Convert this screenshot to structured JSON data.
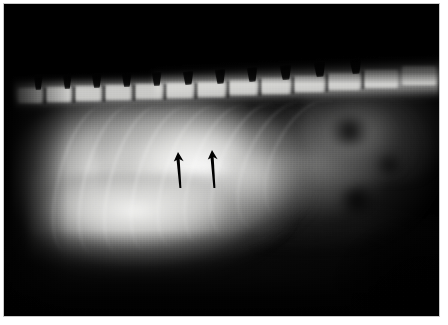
{
  "image": {
    "kind": "radiograph",
    "modality": "X-ray",
    "view": "right lateral",
    "region": "thorax and cranial abdomen",
    "subject": "small animal (canine/feline)",
    "background_color": "#000000",
    "page_background": "#ffffff",
    "frame_color": "#c9c9c9",
    "width": 448,
    "height": 325,
    "caption": "",
    "visible_text": ""
  },
  "annotations": {
    "arrow_color": "#000000",
    "count": 2,
    "arrows": [
      {
        "name": "arrow-left",
        "label": "",
        "direction": "up",
        "x": 178,
        "y": 152,
        "length": 36,
        "tip_x": 178,
        "tip_y": 152,
        "tail_y": 188
      },
      {
        "name": "arrow-right",
        "label": "",
        "direction": "up",
        "x": 212,
        "y": 150,
        "length": 38,
        "tip_x": 212,
        "tip_y": 150,
        "tail_y": 188
      }
    ]
  },
  "anatomy": {
    "structures": [
      {
        "name": "vertebral-column",
        "label": "",
        "density": "bone"
      },
      {
        "name": "dorsal-spinous-processes",
        "label": "",
        "density": "bone"
      },
      {
        "name": "ribs",
        "label": "",
        "density": "bone"
      },
      {
        "name": "soft-tissue-mass",
        "label": "",
        "density": "soft-tissue"
      },
      {
        "name": "diaphragm",
        "label": "",
        "density": "soft-tissue"
      },
      {
        "name": "gas-filled-viscera",
        "label": "",
        "density": "gas"
      }
    ],
    "vertebrae": [
      {
        "x": 18,
        "y": 88,
        "w": 24,
        "h": 15
      },
      {
        "x": 46,
        "y": 87,
        "w": 25,
        "h": 15
      },
      {
        "x": 75,
        "y": 86,
        "w": 26,
        "h": 15
      },
      {
        "x": 105,
        "y": 85,
        "w": 26,
        "h": 15
      },
      {
        "x": 135,
        "y": 84,
        "w": 27,
        "h": 15
      },
      {
        "x": 166,
        "y": 83,
        "w": 27,
        "h": 15
      },
      {
        "x": 197,
        "y": 82,
        "w": 28,
        "h": 15
      },
      {
        "x": 229,
        "y": 80,
        "w": 28,
        "h": 15
      },
      {
        "x": 261,
        "y": 78,
        "w": 29,
        "h": 16
      },
      {
        "x": 294,
        "y": 76,
        "w": 30,
        "h": 16
      },
      {
        "x": 328,
        "y": 73,
        "w": 32,
        "h": 17
      },
      {
        "x": 364,
        "y": 70,
        "w": 34,
        "h": 18
      },
      {
        "x": 402,
        "y": 66,
        "w": 34,
        "h": 19
      }
    ],
    "spinous_processes": [
      {
        "x": 34,
        "y": 76,
        "w": 9,
        "h": 14,
        "rot": -2
      },
      {
        "x": 63,
        "y": 75,
        "w": 9,
        "h": 14,
        "rot": -2
      },
      {
        "x": 92,
        "y": 74,
        "w": 10,
        "h": 14,
        "rot": -3
      },
      {
        "x": 122,
        "y": 73,
        "w": 10,
        "h": 14,
        "rot": -3
      },
      {
        "x": 152,
        "y": 72,
        "w": 10,
        "h": 14,
        "rot": -3
      },
      {
        "x": 183,
        "y": 71,
        "w": 11,
        "h": 14,
        "rot": -4
      },
      {
        "x": 215,
        "y": 69,
        "w": 11,
        "h": 15,
        "rot": -4
      },
      {
        "x": 247,
        "y": 67,
        "w": 11,
        "h": 15,
        "rot": -4
      },
      {
        "x": 280,
        "y": 65,
        "w": 12,
        "h": 15,
        "rot": -5
      },
      {
        "x": 314,
        "y": 62,
        "w": 12,
        "h": 15,
        "rot": -5
      },
      {
        "x": 350,
        "y": 59,
        "w": 12,
        "h": 15,
        "rot": -5
      }
    ],
    "disc_spaces": [
      {
        "x": 44,
        "y": 88,
        "h": 16
      },
      {
        "x": 73,
        "y": 87,
        "h": 16
      },
      {
        "x": 103,
        "y": 86,
        "h": 16
      },
      {
        "x": 133,
        "y": 85,
        "h": 16
      },
      {
        "x": 164,
        "y": 84,
        "h": 16
      },
      {
        "x": 195,
        "y": 83,
        "h": 16
      },
      {
        "x": 227,
        "y": 81,
        "h": 17
      },
      {
        "x": 259,
        "y": 79,
        "h": 17
      },
      {
        "x": 292,
        "y": 77,
        "h": 17
      },
      {
        "x": 326,
        "y": 74,
        "h": 18
      },
      {
        "x": 362,
        "y": 71,
        "h": 18
      }
    ],
    "ribs": [
      {
        "x": 58,
        "y": 104,
        "w": 52,
        "h": 150,
        "rot": 14,
        "op": 0.26
      },
      {
        "x": 84,
        "y": 104,
        "w": 54,
        "h": 152,
        "rot": 14,
        "op": 0.28
      },
      {
        "x": 110,
        "y": 104,
        "w": 56,
        "h": 152,
        "rot": 15,
        "op": 0.3
      },
      {
        "x": 137,
        "y": 104,
        "w": 58,
        "h": 150,
        "rot": 16,
        "op": 0.3
      },
      {
        "x": 164,
        "y": 103,
        "w": 60,
        "h": 148,
        "rot": 17,
        "op": 0.28
      },
      {
        "x": 191,
        "y": 102,
        "w": 62,
        "h": 146,
        "rot": 18,
        "op": 0.26
      },
      {
        "x": 218,
        "y": 100,
        "w": 64,
        "h": 142,
        "rot": 20,
        "op": 0.24
      },
      {
        "x": 245,
        "y": 98,
        "w": 66,
        "h": 136,
        "rot": 22,
        "op": 0.2
      },
      {
        "x": 272,
        "y": 96,
        "w": 66,
        "h": 128,
        "rot": 24,
        "op": 0.16
      }
    ]
  }
}
